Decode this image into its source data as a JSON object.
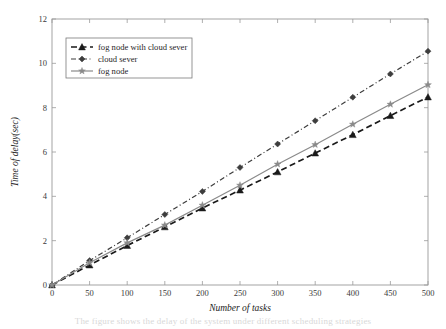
{
  "chart_data": {
    "type": "line",
    "title": "",
    "xlabel": "Number of tasks",
    "ylabel": "Time of delay(sec)",
    "xlim": [
      0,
      500
    ],
    "ylim": [
      0,
      12
    ],
    "x": [
      0,
      50,
      100,
      150,
      200,
      250,
      300,
      350,
      400,
      450,
      500
    ],
    "xticks": [
      "0",
      "50",
      "100",
      "150",
      "200",
      "250",
      "300",
      "350",
      "400",
      "450",
      "500"
    ],
    "yticks": [
      "0",
      "2",
      "4",
      "6",
      "8",
      "10",
      "12"
    ],
    "grid": false,
    "legend_position": "upper left",
    "series": [
      {
        "name": "fog node with cloud sever",
        "marker": "triangle",
        "linestyle": "dashed",
        "color": "#1a1a1a",
        "values": [
          0,
          0.9,
          1.78,
          2.62,
          3.47,
          4.28,
          5.1,
          5.95,
          6.78,
          7.64,
          8.48
        ]
      },
      {
        "name": "cloud sever",
        "marker": "diamond",
        "linestyle": "dash-dot",
        "color": "#3d3d3d",
        "values": [
          0,
          1.1,
          2.13,
          3.18,
          4.22,
          5.3,
          6.36,
          7.41,
          8.47,
          9.52,
          10.55
        ]
      },
      {
        "name": "fog node",
        "marker": "star",
        "linestyle": "solid",
        "color": "#8a8a8a",
        "values": [
          0,
          1.0,
          1.9,
          2.7,
          3.6,
          4.5,
          5.45,
          6.33,
          7.25,
          8.15,
          9.03
        ]
      }
    ]
  },
  "legend": {
    "entries": [
      {
        "label": "fog node with cloud sever",
        "marker_icon": "triangle-marker-icon"
      },
      {
        "label": "cloud sever",
        "marker_icon": "diamond-marker-icon"
      },
      {
        "label": "fog node",
        "marker_icon": "star-marker-icon"
      }
    ]
  },
  "background_bleed": {
    "line1": "fog node with cloud sever",
    "line2": "The figure shows the delay of the system under different scheduling strategies"
  }
}
